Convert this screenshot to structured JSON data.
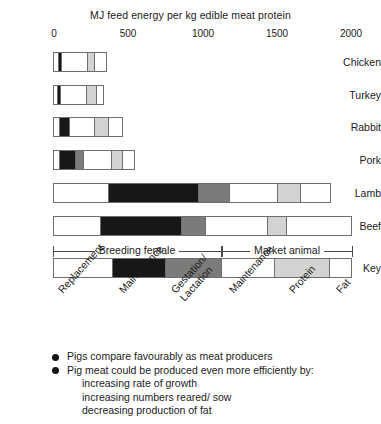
{
  "chart_data": {
    "type": "bar",
    "subtype": "horizontal-stacked",
    "title": "MJ feed energy per kg edible meat protein",
    "xlabel": "",
    "ylabel": "",
    "xlim": [
      0,
      2000
    ],
    "xticks": [
      0,
      500,
      1000,
      1500,
      2000
    ],
    "xtick_labels": [
      "0",
      "500",
      "1000",
      "1500",
      "2000"
    ],
    "grid": false,
    "legend_position": "key-bar-below-chart",
    "categories": [
      "Chicken",
      "Turkey",
      "Rabbit",
      "Pork",
      "Lamb",
      "Beef",
      "Key"
    ],
    "series": [
      {
        "name": "Replacement",
        "fill": "white",
        "color": "#ffffff",
        "values": [
          30,
          25,
          40,
          35,
          370,
          315,
          400
        ]
      },
      {
        "name": "Maintenance",
        "fill": "black",
        "color": "#171717",
        "values": [
          15,
          15,
          65,
          115,
          610,
          550,
          350
        ]
      },
      {
        "name": "Gestation/Lactation",
        "fill": "dark-gray",
        "color": "#7b7b7b",
        "values": [
          0,
          0,
          0,
          45,
          210,
          155,
          380
        ]
      },
      {
        "name": "Maintenance",
        "fill": "white",
        "color": "#ffffff",
        "values": [
          190,
          185,
          175,
          200,
          320,
          415,
          355
        ]
      },
      {
        "name": "Protein",
        "fill": "light-gray",
        "color": "#d3d3d3",
        "values": [
          40,
          70,
          95,
          75,
          150,
          130,
          370
        ]
      },
      {
        "name": "Fat",
        "fill": "white",
        "color": "#ffffff",
        "values": [
          85,
          45,
          95,
          80,
          200,
          435,
          145
        ]
      }
    ],
    "totals": [
      360,
      340,
      470,
      550,
      1860,
      2000,
      2000
    ],
    "annotations": [
      {
        "text": "Breeding female",
        "from": 0,
        "to": 1130
      },
      {
        "text": "Market animal",
        "from": 1130,
        "to": 2000
      }
    ],
    "key_labels": [
      "Replacement",
      "Maintenance",
      "Gestation/ Lactation",
      "Maintenance",
      "Protein",
      "Fat"
    ]
  },
  "axis": {
    "tick_labels": [
      "0",
      "500",
      "1000",
      "1500",
      "2000"
    ]
  },
  "rows": [
    {
      "label": "Chicken"
    },
    {
      "label": "Turkey"
    },
    {
      "label": "Rabbit"
    },
    {
      "label": "Pork"
    },
    {
      "label": "Lamb"
    },
    {
      "label": "Beef"
    },
    {
      "label": "Key"
    }
  ],
  "bracket": {
    "breeding_female": "Breeding female",
    "market_animal": "Market animal"
  },
  "key_labels": {
    "replacement": "Replacement",
    "maintenance_1": "Maintenance",
    "gestation_line1": "Gestation/",
    "gestation_line2": "Lactation",
    "maintenance_2": "Maintenance",
    "protein": "Protein",
    "fat": "Fat"
  },
  "notes": {
    "bullet_1": "Pigs compare favourably as meat producers",
    "bullet_2": "Pig meat could be produced even more efficiently by:",
    "sub_1": "increasing rate of growth",
    "sub_2": "increasing numbers reared/ sow",
    "sub_3": "decreasing production of fat"
  }
}
